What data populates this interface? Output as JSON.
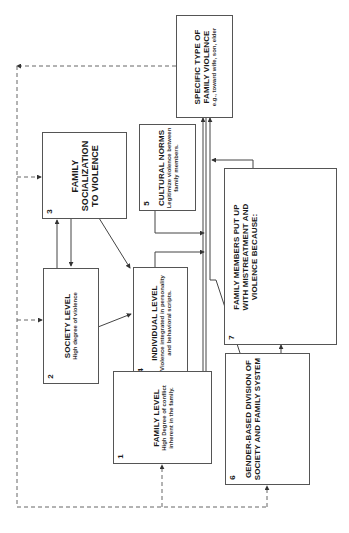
{
  "diagram": {
    "boxes": {
      "specific": {
        "number": "",
        "title": "SPECIFIC TYPE OF FAMILY VIOLENCE",
        "subtitle": "e.g., toward wife, son, elder"
      },
      "b1": {
        "number": "1",
        "title": "FAMILY LEVEL",
        "subtitle": "High Degree of conflict inherent in the family."
      },
      "b2": {
        "number": "2",
        "title": "SOCIETY LEVEL",
        "subtitle": "High degree of violence"
      },
      "b3": {
        "number": "3",
        "title": "FAMILY SOCIALIZATION TO VIOLENCE",
        "subtitle": ""
      },
      "b4": {
        "number": "4",
        "title": "INDIVIDUAL LEVEL",
        "subtitle": "Violence integrated in personality and behavioral scripts."
      },
      "b5": {
        "number": "5",
        "title": "CULTURAL NORMS",
        "subtitle": "Legitimize violence between family members."
      },
      "b6": {
        "number": "6",
        "title": "GENDER-BASED DIVISION OF SOCIETY AND FAMILY SYSTEM",
        "subtitle": ""
      },
      "b7": {
        "number": "7",
        "title": "FAMILY MEMBERS PUT UP WITH MISTREATMENT AND VIOLENCE BECAUSE:",
        "subtitle": ""
      }
    },
    "orientation": "rotated 90° counter-clockwise",
    "line_color": "#555555"
  }
}
